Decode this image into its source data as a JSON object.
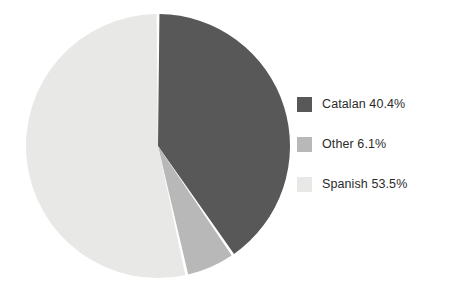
{
  "chart_data": {
    "type": "pie",
    "title": "",
    "subtitle": "",
    "xlabel": "",
    "ylabel": "",
    "grid": false,
    "legend_position": "right",
    "start_angle_deg": 0,
    "direction": "clockwise",
    "categories": [
      "Catalan",
      "Other",
      "Spanish"
    ],
    "values": [
      40.4,
      6.1,
      53.5
    ],
    "value_unit": "%",
    "colors": [
      "#585858",
      "#b8b8b8",
      "#e8e8e6"
    ],
    "slice_gap_color": "#ffffff",
    "slices": [
      {
        "label": "Catalan",
        "value": 40.4,
        "display": "40.4%",
        "color": "#585858"
      },
      {
        "label": "Other",
        "value": 6.1,
        "display": "6.1%",
        "color": "#b8b8b8"
      },
      {
        "label": "Spanish",
        "value": 53.5,
        "display": "53.5%",
        "color": "#e8e8e6"
      }
    ]
  },
  "legend": {
    "entries": [
      {
        "label": "Catalan 40.4%",
        "color": "#585858",
        "swatch_name": "legend-swatch-catalan"
      },
      {
        "label": "Other 6.1%",
        "color": "#b8b8b8",
        "swatch_name": "legend-swatch-other"
      },
      {
        "label": "Spanish 53.5%",
        "color": "#e8e8e6",
        "swatch_name": "legend-swatch-spanish"
      }
    ]
  },
  "geometry": {
    "center_x": 158,
    "center_y": 146,
    "radius": 132
  },
  "colors": {
    "background": "#ffffff",
    "text": "#2b2b2b",
    "catalan": "#585858",
    "other": "#b8b8b8",
    "spanish": "#e8e8e6"
  }
}
